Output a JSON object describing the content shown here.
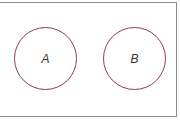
{
  "diagram": {
    "type": "venn",
    "sets": [
      {
        "label": "A",
        "color": "#8e3a55"
      },
      {
        "label": "B",
        "color": "#8e3a55"
      }
    ],
    "frame_color": "#8a8a8a"
  }
}
